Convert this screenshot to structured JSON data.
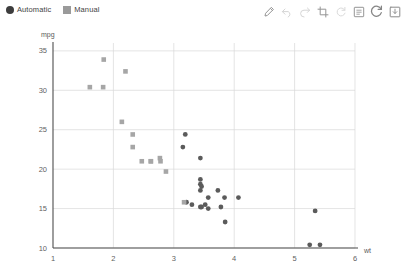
{
  "legend": {
    "position": "top-left",
    "entries": [
      {
        "label": "Automatic",
        "marker": "circle",
        "color": "#3d3d3d"
      },
      {
        "label": "Manual",
        "marker": "square",
        "color": "#9a9a9a"
      }
    ]
  },
  "toolbar": {
    "buttons": [
      {
        "name": "draw-pencil-icon",
        "title": "Draw",
        "enabled": true
      },
      {
        "name": "undo-icon",
        "title": "Undo",
        "enabled": false
      },
      {
        "name": "redo-icon",
        "title": "Redo",
        "enabled": false
      },
      {
        "name": "crop-icon",
        "title": "Crop",
        "enabled": true
      },
      {
        "name": "rotate-icon",
        "title": "Rotate",
        "enabled": false
      },
      {
        "name": "notes-icon",
        "title": "Notes",
        "enabled": true
      },
      {
        "name": "refresh-icon",
        "title": "Refresh",
        "enabled": true
      },
      {
        "name": "save-icon",
        "title": "Save",
        "enabled": true
      }
    ]
  },
  "chart_data": {
    "type": "scatter",
    "title": "",
    "xlabel": "wt",
    "ylabel": "mpg",
    "xlim": [
      1,
      6
    ],
    "ylim": [
      10,
      36
    ],
    "xticks": [
      1,
      2,
      3,
      4,
      5,
      6
    ],
    "yticks": [
      10,
      15,
      20,
      25,
      30,
      35
    ],
    "grid": true,
    "legend_position": "top-left",
    "series": [
      {
        "name": "Automatic",
        "marker": "circle",
        "color": "#5b5b5b",
        "points": [
          [
            3.19,
            24.4
          ],
          [
            3.15,
            22.8
          ],
          [
            3.44,
            21.4
          ],
          [
            3.44,
            18.7
          ],
          [
            3.44,
            18.1
          ],
          [
            3.46,
            17.8
          ],
          [
            3.44,
            17.3
          ],
          [
            3.57,
            16.4
          ],
          [
            3.73,
            17.3
          ],
          [
            3.52,
            15.5
          ],
          [
            3.44,
            15.2
          ],
          [
            3.57,
            15.0
          ],
          [
            3.78,
            15.2
          ],
          [
            3.84,
            16.4
          ],
          [
            3.85,
            13.3
          ],
          [
            4.07,
            16.4
          ],
          [
            5.25,
            10.4
          ],
          [
            5.42,
            10.4
          ],
          [
            5.34,
            14.7
          ],
          [
            3.21,
            15.8
          ],
          [
            3.46,
            15.2
          ],
          [
            3.3,
            15.5
          ]
        ]
      },
      {
        "name": "Manual",
        "marker": "square",
        "color": "#a6a6a6",
        "points": [
          [
            1.61,
            30.4
          ],
          [
            1.83,
            30.4
          ],
          [
            1.84,
            33.9
          ],
          [
            2.2,
            32.4
          ],
          [
            2.14,
            26.0
          ],
          [
            2.32,
            22.8
          ],
          [
            2.47,
            21.0
          ],
          [
            2.62,
            21.0
          ],
          [
            2.77,
            21.4
          ],
          [
            2.78,
            21.0
          ],
          [
            2.87,
            19.7
          ],
          [
            2.32,
            24.4
          ],
          [
            3.17,
            15.8
          ],
          [
            2.62,
            21.0
          ]
        ]
      }
    ]
  }
}
